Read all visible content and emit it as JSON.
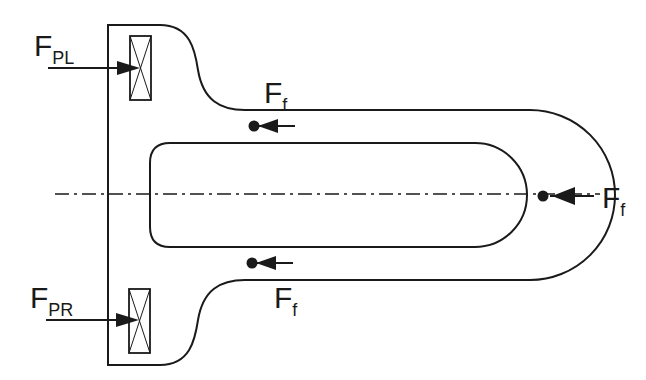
{
  "diagram": {
    "type": "force-diagram",
    "labels": {
      "fpl_main": "F",
      "fpl_sub": "PL",
      "fpr_main": "F",
      "fpr_sub": "PR",
      "ff_top_main": "F",
      "ff_top_sub": "f",
      "ff_bottom_main": "F",
      "ff_bottom_sub": "f",
      "ff_right_main": "F",
      "ff_right_sub": "f"
    },
    "colors": {
      "stroke": "#1a1a1a",
      "background": "#ffffff"
    }
  }
}
